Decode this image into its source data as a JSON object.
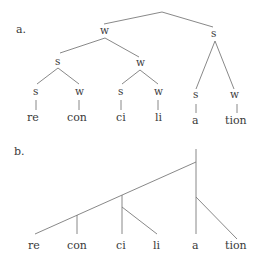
{
  "figure": {
    "panel_a": {
      "label": "a.",
      "root": {
        "children": [
          "w",
          "s"
        ]
      },
      "level1": [
        "w",
        "s"
      ],
      "level2": [
        "s",
        "w",
        "s",
        "w"
      ],
      "level3": [
        "s",
        "w",
        "s",
        "w",
        "s",
        "w"
      ],
      "syllables": [
        "re",
        "con",
        "ci",
        "li",
        "a",
        "tion"
      ]
    },
    "panel_b": {
      "label": "b.",
      "syllables": [
        "re",
        "con",
        "ci",
        "li",
        "a",
        "tion"
      ]
    }
  }
}
